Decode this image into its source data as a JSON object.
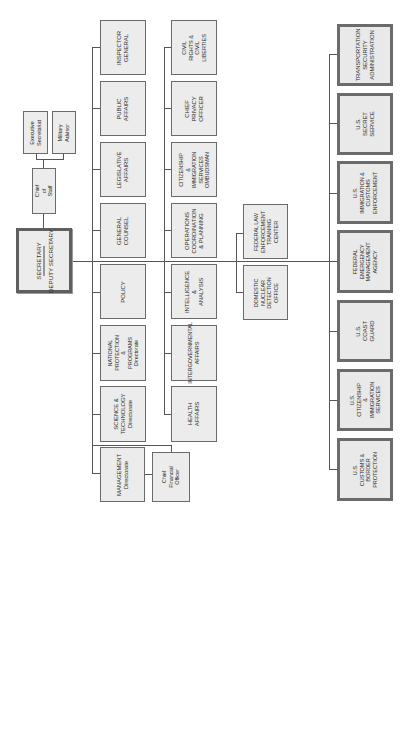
{
  "chart": {
    "orientation": "rotated-90-ccw",
    "colors": {
      "box_fill": "#ececec",
      "box_border": "#6a6a6a",
      "line": "#555555",
      "text": "#2e2e2e"
    },
    "top": {
      "secretary": "SECRETARY",
      "deputy_secretary": "DEPUTY SECRETARY",
      "chief_of_staff": "Chief of Staff",
      "executive_secretariat": "Executive\nSecretariat",
      "military_advisor": "Military Advisor"
    },
    "column1": [
      "INSPECTOR\nGENERAL",
      "PUBLIC AFFAIRS",
      "LEGISLATIVE AFFAIRS",
      "GENERAL COUNSEL",
      "POLICY",
      "NATIONAL PROTECTION\n& PROGRAMS\nDirectorate",
      "SCIENCE &\nTECHNOLOGY\nDirectorate",
      "MANAGEMENT\nDirectorate"
    ],
    "cfo": "Chief Financial\nOfficer",
    "column2": [
      "CIVIL RIGHTS & CIVIL\nLIBERTIES",
      "CHIEF PRIVACY\nOFFICER",
      "CITIZENSHIP &\nIMMIGRATION\nSERVICES\nOMBUDSMAN",
      "OPERATIONS\nCOORDINATION\n& PLANNING",
      "INTELLIGENCE &\nANALYSIS",
      "INTERGOVERNMENTAL\nAFFAIRS",
      "HEALTH AFFAIRS"
    ],
    "column3": [
      "FEDERAL LAW\nENFORCEMENT\nTRAINING CENTER",
      "DOMESTIC NUCLEAR\nDETECTION OFFICE"
    ],
    "column4": [
      "TRANSPORTATION\nSECURITY\nADMINISTRATION",
      "U.S. SECRET SERVICE",
      "U.S. IMMIGRATION &\nCUSTOMS ENFORCEMENT",
      "FEDERAL EMERGENCY\nMANAGEMENT AGENCY",
      "U.S. COAST GUARD",
      "U.S. CITIZENSHIP &\nIMMIGRATION SERVICES",
      "U.S. CUSTOMS & BORDER\nPROTECTION"
    ]
  }
}
